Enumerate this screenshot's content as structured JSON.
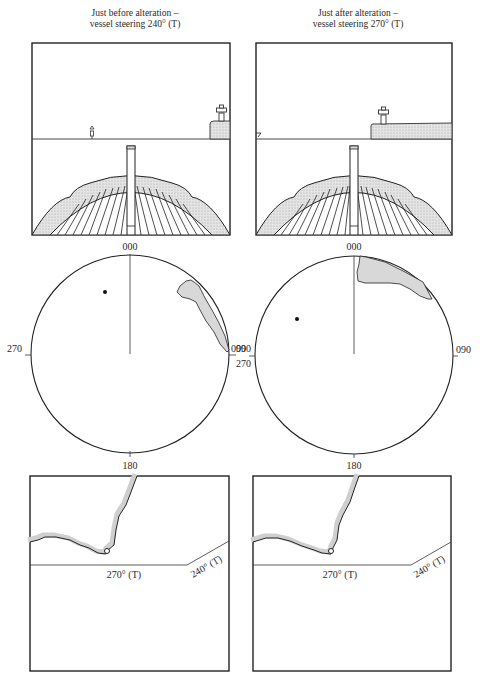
{
  "panels": {
    "left": {
      "caption_line1": "Just before alteration –",
      "caption_line2": "vessel steering 240° (T)",
      "heading_deg": 240
    },
    "right": {
      "caption_line1": "Just after alteration –",
      "caption_line2": "vessel steering 270° (T)",
      "heading_deg": 270
    }
  },
  "compass_left": {
    "top": "000",
    "left": "270",
    "right": "090",
    "bottom": "180"
  },
  "compass_right": {
    "top": "000",
    "left_upper": "090",
    "left_lower": "270",
    "right": "090",
    "bottom": "180"
  },
  "chart_left": {
    "course_old": "270° (T)",
    "course_new": "240° (T)"
  },
  "chart_right": {
    "course_old": "270° (T)",
    "course_new": "240° (T)"
  },
  "colors": {
    "ink": "#222222",
    "land_fill": "#d8d8d8",
    "coast_shade": "#cfcfcf"
  }
}
